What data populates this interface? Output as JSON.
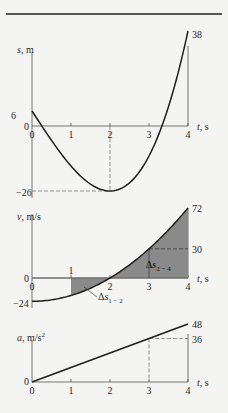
{
  "chart_data": [
    {
      "type": "line",
      "title": "",
      "ylabel": "s, m",
      "xlabel": "t, s",
      "x_ticks": [
        "0",
        "1",
        "2",
        "3",
        "4"
      ],
      "y_ticks": [
        "6",
        "0",
        "-26",
        "38"
      ],
      "equation": "s = 2t^3 - 24t + 6",
      "x": [
        0,
        0.5,
        1,
        1.5,
        2,
        2.5,
        3,
        3.5,
        4
      ],
      "values": [
        6,
        -5.75,
        -16,
        -23.25,
        -26,
        -22.75,
        -12,
        9.75,
        38
      ],
      "annotations": [
        {
          "text": "-26",
          "at": [
            2,
            -26
          ],
          "dashed_guides": true
        },
        {
          "text": "38",
          "at": [
            4,
            38
          ]
        },
        {
          "text": "6",
          "at": [
            0,
            6
          ]
        }
      ],
      "ylim": [
        -26,
        38
      ],
      "xlim": [
        0,
        4
      ],
      "grid": false
    },
    {
      "type": "area",
      "ylabel": "v, m/s",
      "xlabel": "t, s",
      "x_ticks": [
        "0",
        "1",
        "2",
        "3",
        "4"
      ],
      "y_ticks": [
        "72",
        "30",
        "0",
        "-24"
      ],
      "equation": "v = 6t^2 - 24",
      "x": [
        0,
        0.5,
        1,
        1.5,
        2,
        2.5,
        3,
        3.5,
        4
      ],
      "values": [
        -24,
        -22.5,
        -18,
        -10.5,
        0,
        13.5,
        30,
        49.5,
        72
      ],
      "shaded_regions": [
        {
          "from": 1,
          "to": 2,
          "label": "Δs1-2"
        },
        {
          "from": 2,
          "to": 4,
          "label": "Δs2-4"
        }
      ],
      "annotations": [
        {
          "text": "30",
          "at": [
            3,
            30
          ],
          "dashed_guides": true
        },
        {
          "text": "72",
          "at": [
            4,
            72
          ]
        },
        {
          "text": "1",
          "at": [
            1,
            0
          ]
        }
      ],
      "ylim": [
        -24,
        72
      ],
      "xlim": [
        0,
        4
      ],
      "grid": false
    },
    {
      "type": "line",
      "ylabel": "a, m/s²",
      "xlabel": "t, s",
      "x_ticks": [
        "0",
        "1",
        "2",
        "3",
        "4"
      ],
      "y_ticks": [
        "48",
        "36",
        "0"
      ],
      "equation": "a = 12t",
      "x": [
        0,
        1,
        2,
        3,
        4
      ],
      "values": [
        0,
        12,
        24,
        36,
        48
      ],
      "annotations": [
        {
          "text": "36",
          "at": [
            3,
            36
          ],
          "dashed_guides": true
        },
        {
          "text": "48",
          "at": [
            4,
            48
          ]
        }
      ],
      "ylim": [
        0,
        48
      ],
      "xlim": [
        0,
        4
      ],
      "grid": false
    }
  ],
  "labels": {
    "s_axis": "s, m",
    "v_axis": "v, m/s",
    "a_axis": "a, m/s",
    "a_sup": "2",
    "t_axis": "t, s",
    "delta12": "Δs",
    "delta12_sub": "1 − 2",
    "delta24": "Δs",
    "delta24_sub": "2 − 4"
  },
  "colors": {
    "curve": "#1e1e1e",
    "shade": "#8a8a8a",
    "axis": "#555555",
    "dash": "#666666",
    "rule": "#222222"
  }
}
